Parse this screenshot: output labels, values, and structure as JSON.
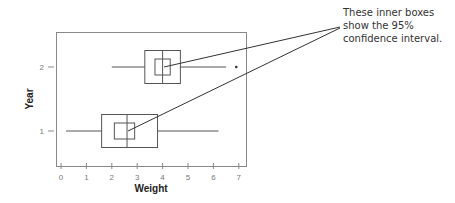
{
  "chart_data": {
    "type": "boxplot",
    "title": "",
    "xlabel": "Weight",
    "ylabel": "Year",
    "xlim": [
      0,
      7
    ],
    "x_ticks": [
      "0",
      "1",
      "2",
      "3",
      "4",
      "5",
      "6",
      "7"
    ],
    "y_ticks": [
      "1",
      "2"
    ],
    "grid": false,
    "legend": null,
    "series": [
      {
        "name": "1",
        "whisker_low": 0.2,
        "q1": 1.6,
        "median": 2.6,
        "q3": 3.8,
        "whisker_high": 6.2,
        "ci_low": 2.1,
        "ci_high": 2.9,
        "outliers": []
      },
      {
        "name": "2",
        "whisker_low": 2.0,
        "q1": 3.3,
        "median": 4.0,
        "q3": 4.7,
        "whisker_high": 6.5,
        "ci_low": 3.7,
        "ci_high": 4.3,
        "outliers": [
          6.9
        ]
      }
    ],
    "annotations": [
      {
        "text": "These inner boxes show the 95% confidence interval.",
        "points_to": [
          "Year 2 inner box",
          "Year 1 inner box"
        ]
      }
    ]
  },
  "annotation": {
    "line1": "These inner boxes",
    "line2": "show the 95%",
    "line3": "confidence interval."
  },
  "colors": {
    "frame": "#777777",
    "box": "#555555",
    "leader": "#333333"
  }
}
